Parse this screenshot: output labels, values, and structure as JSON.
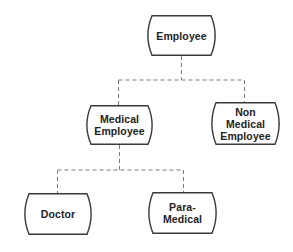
{
  "diagram": {
    "type": "hierarchy",
    "line_color": "#3a3a3a",
    "connector_color": "#7a7a7a",
    "connector_style": "dashed",
    "nodes": {
      "employee": {
        "label": "Employee"
      },
      "medical_employee": {
        "label": "Medical\nEmployee"
      },
      "non_medical_employee": {
        "label": "Non\nMedical\nEmployee"
      },
      "doctor": {
        "label": "Doctor"
      },
      "para_medical": {
        "label": "Para-\nMedical"
      }
    },
    "edges": [
      {
        "from": "Employee",
        "to": "Medical Employee"
      },
      {
        "from": "Employee",
        "to": "Non Medical Employee"
      },
      {
        "from": "Medical Employee",
        "to": "Doctor"
      },
      {
        "from": "Medical Employee",
        "to": "Para-Medical"
      }
    ]
  }
}
